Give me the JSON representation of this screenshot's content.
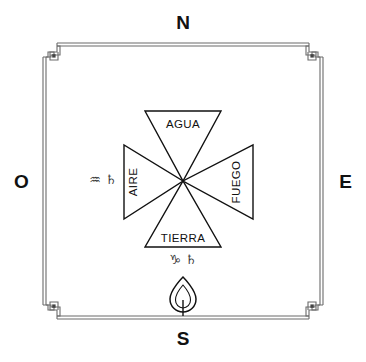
{
  "diagram": {
    "background_color": "#ffffff",
    "ink_color": "#111111",
    "frame_color": "#6b6b6b"
  },
  "compass": {
    "north_label": "N",
    "south_label": "S",
    "east_label": "E",
    "west_label": "O"
  },
  "elements": [
    {
      "name": "agua",
      "label": "AGUA",
      "position": "north",
      "triangle": "down"
    },
    {
      "name": "fuego",
      "label": "FUEGO",
      "position": "east",
      "triangle": "left"
    },
    {
      "name": "tierra",
      "label": "TIERRA",
      "position": "south",
      "triangle": "up"
    },
    {
      "name": "aire",
      "label": "AIRE",
      "position": "west",
      "triangle": "right"
    }
  ],
  "sigils": {
    "west": {
      "name": "aquarius-saturn",
      "zodiac_symbol": "♒",
      "planet_symbol": "♄",
      "combined": "♒ ♄"
    },
    "south": {
      "name": "capricorn-saturn",
      "zodiac_symbol": "♑",
      "planet_symbol": "♄",
      "combined": "♑ ♄"
    }
  },
  "flame": {
    "name": "flame-glyph",
    "position": "south"
  },
  "ornaments": {
    "corner_style": "greek-key-spiral",
    "corner_count": 4,
    "border_style": "double-line"
  }
}
